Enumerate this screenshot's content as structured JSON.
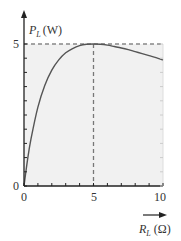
{
  "chart_data": {
    "type": "line",
    "title": "",
    "xlabel": "R_L (Ω)",
    "ylabel": "P_L (W)",
    "xlabel_main": "R",
    "xlabel_sub": "L",
    "xlabel_unit": "(Ω)",
    "ylabel_main": "P",
    "ylabel_sub": "L",
    "ylabel_unit": "(W)",
    "xlim": [
      0,
      10
    ],
    "ylim": [
      0,
      5
    ],
    "x_ticks": [
      "0",
      "5",
      "10"
    ],
    "y_ticks": [
      "0",
      "5"
    ],
    "x_minor_step": 1,
    "y_minor_step": 0.5,
    "grid": false,
    "legend": "none",
    "series": [
      {
        "name": "P_L vs R_L",
        "x": [
          0,
          0.25,
          0.5,
          1,
          1.5,
          2,
          2.5,
          3,
          3.5,
          4,
          4.5,
          5,
          5.5,
          6,
          6.5,
          7,
          7.5,
          8,
          8.5,
          9,
          9.5,
          10
        ],
        "values": [
          0,
          0.91,
          1.65,
          2.78,
          3.55,
          4.08,
          4.44,
          4.69,
          4.84,
          4.94,
          4.99,
          5.0,
          4.99,
          4.96,
          4.91,
          4.86,
          4.8,
          4.73,
          4.66,
          4.59,
          4.52,
          4.44
        ]
      }
    ],
    "annotations": [
      {
        "type": "dashed-vline",
        "x": 5,
        "from_y": 0,
        "to_y": 5
      },
      {
        "type": "dashed-hline",
        "y": 5,
        "from_x": 0,
        "to_x": 10
      }
    ],
    "colors": {
      "plot_background": "#f1f1f1",
      "curve": "#555555",
      "axes": "#222222",
      "dashed": "#777777"
    }
  }
}
